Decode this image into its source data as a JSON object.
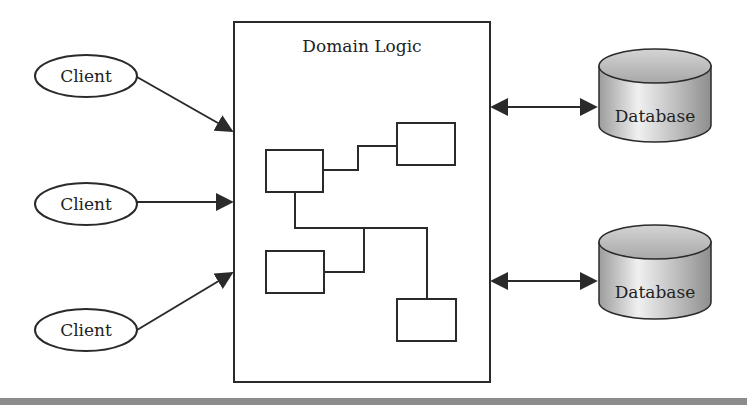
{
  "diagram": {
    "title": "Domain Logic",
    "clients": [
      {
        "label": "Client"
      },
      {
        "label": "Client"
      },
      {
        "label": "Client"
      }
    ],
    "databases": [
      {
        "label": "Database"
      },
      {
        "label": "Database"
      }
    ],
    "colors": {
      "stroke": "#2a2a2a",
      "db_fill_light": "#e8e8e8",
      "db_fill_dark": "#9a9a9a",
      "footer_bar": "#8c8c8c"
    }
  }
}
